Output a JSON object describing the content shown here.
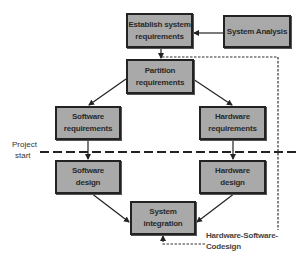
{
  "diagram": {
    "type": "flowchart",
    "title": "",
    "colors": {
      "box_fill": "#a9a9a9",
      "box_border": "#222222",
      "line": "#222222",
      "text": "#2a2a2a"
    },
    "nodes": {
      "establish": {
        "line1": "Establish system",
        "line2": "requirements"
      },
      "analysis": {
        "line1": "System Analysis"
      },
      "partition": {
        "line1": "Partition",
        "line2": "requirements"
      },
      "sw_req": {
        "line1": "Software",
        "line2": "requirements"
      },
      "hw_req": {
        "line1": "Hardware",
        "line2": "requirements"
      },
      "sw_design": {
        "line1": "Software",
        "line2": "design"
      },
      "hw_design": {
        "line1": "Hardware",
        "line2": "design"
      },
      "integration": {
        "line1": "System",
        "line2": "integration"
      }
    },
    "labels": {
      "project_start_1": "Project",
      "project_start_2": "start",
      "codesign": "Hardware-Software-Codesign"
    },
    "edges": [
      {
        "from": "analysis",
        "to": "establish",
        "style": "solid"
      },
      {
        "from": "establish",
        "to": "partition",
        "style": "solid"
      },
      {
        "from": "partition",
        "to": "sw_req",
        "style": "solid"
      },
      {
        "from": "partition",
        "to": "hw_req",
        "style": "solid"
      },
      {
        "from": "sw_req",
        "to": "sw_design",
        "style": "solid"
      },
      {
        "from": "hw_req",
        "to": "hw_design",
        "style": "solid"
      },
      {
        "from": "sw_design",
        "to": "integration",
        "style": "solid"
      },
      {
        "from": "hw_design",
        "to": "integration",
        "style": "solid"
      },
      {
        "from": "partition",
        "to": "integration",
        "style": "dashed",
        "label": "Hardware-Software-Codesign"
      }
    ]
  }
}
